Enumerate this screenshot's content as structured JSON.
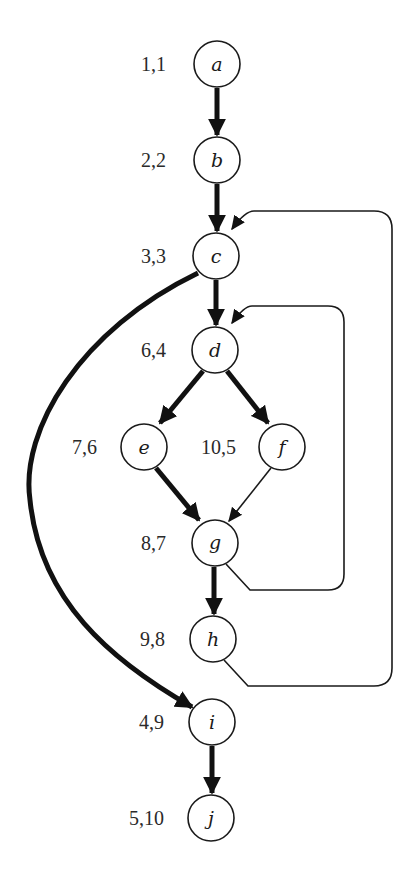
{
  "diagram": {
    "type": "control-flow-graph",
    "nodes": [
      {
        "id": "a",
        "label": "a",
        "numbering": "1,1",
        "x": 217,
        "y": 64
      },
      {
        "id": "b",
        "label": "b",
        "numbering": "2,2",
        "x": 217,
        "y": 160
      },
      {
        "id": "c",
        "label": "c",
        "numbering": "3,3",
        "x": 216,
        "y": 256
      },
      {
        "id": "d",
        "label": "d",
        "numbering": "6,4",
        "x": 215,
        "y": 350
      },
      {
        "id": "e",
        "label": "e",
        "numbering": "7,6",
        "x": 144,
        "y": 447
      },
      {
        "id": "f",
        "label": "f",
        "numbering": "10,5",
        "x": 282,
        "y": 447
      },
      {
        "id": "g",
        "label": "g",
        "numbering": "8,7",
        "x": 215,
        "y": 543
      },
      {
        "id": "h",
        "label": "h",
        "numbering": "9,8",
        "x": 213,
        "y": 639
      },
      {
        "id": "i",
        "label": "i",
        "numbering": "4,9",
        "x": 212,
        "y": 722
      },
      {
        "id": "j",
        "label": "j",
        "numbering": "5,10",
        "x": 211,
        "y": 818
      }
    ],
    "edges": [
      {
        "from": "a",
        "to": "b",
        "style": "thick"
      },
      {
        "from": "b",
        "to": "c",
        "style": "thick"
      },
      {
        "from": "c",
        "to": "d",
        "style": "thick"
      },
      {
        "from": "c",
        "to": "i",
        "style": "thick",
        "shape": "curve"
      },
      {
        "from": "d",
        "to": "e",
        "style": "thick"
      },
      {
        "from": "d",
        "to": "f",
        "style": "thick"
      },
      {
        "from": "e",
        "to": "g",
        "style": "thick"
      },
      {
        "from": "f",
        "to": "g",
        "style": "thin"
      },
      {
        "from": "g",
        "to": "h",
        "style": "thick"
      },
      {
        "from": "g",
        "to": "d",
        "style": "thin",
        "shape": "back-loop"
      },
      {
        "from": "h",
        "to": "c",
        "style": "thin",
        "shape": "back-loop"
      },
      {
        "from": "i",
        "to": "j",
        "style": "thick"
      }
    ]
  }
}
